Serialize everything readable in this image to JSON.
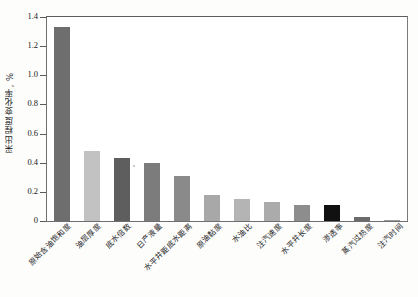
{
  "chart_data": {
    "type": "bar",
    "title": "",
    "xlabel": "",
    "ylabel": "采出程度变化率, %",
    "ylim": [
      0,
      1.4
    ],
    "yticks": [
      "0",
      "0.2",
      "0.4",
      "0.6",
      "0.8",
      "1.0",
      "1.2",
      "1.4"
    ],
    "grid": false,
    "legend": null,
    "categories": [
      "原始含油饱和度",
      "油层厚度",
      "底水倍数",
      "日产液量",
      "水平井距底水距离",
      "原油黏度",
      "水油比",
      "注汽速度",
      "水平井长度",
      "渗透率",
      "蒸汽过热度",
      "注汽时间"
    ],
    "values": [
      1.33,
      0.48,
      0.43,
      0.4,
      0.31,
      0.18,
      0.15,
      0.13,
      0.11,
      0.11,
      0.03,
      0.01
    ],
    "bar_colors": [
      "#6e6e6e",
      "#c2c2c2",
      "#5e5e5e",
      "#7c7c7c",
      "#8a8a8a",
      "#a8a8a8",
      "#b4b4b4",
      "#ababab",
      "#8d8d8d",
      "#111111",
      "#6b6b6b",
      "#9a9a9a"
    ]
  },
  "axis": {
    "frame_color": "#6f6f6f",
    "tick_color": "#5a5a5a"
  }
}
